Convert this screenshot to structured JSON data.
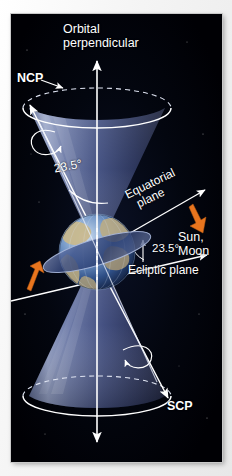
{
  "figure": {
    "domain": "diagram",
    "background_color": "#000006",
    "page_color": "#f2f2f2",
    "plate": {
      "x": 11,
      "y": 14,
      "width": 211,
      "height": 448
    }
  },
  "labels": {
    "orbital_perpendicular": "Orbital\nperpendicular",
    "ncp": "NCP",
    "scp": "SCP",
    "angle_top": "23.5°",
    "angle_bottom": "23.5°",
    "equatorial_plane": "Equatorial\n  plane",
    "ecliptic_plane": "Ecliptic plane",
    "sun_moon": "Sun,\nMoon"
  },
  "colors": {
    "line": "#ffffff",
    "cone_light": "#b9c4dd",
    "cone_mid": "#4b5f93",
    "cone_dark": "#141c38",
    "orange_arrow": "#e8751e",
    "earth_ocean": "#2f5fa8",
    "earth_land": "#c9b88c",
    "equator_disc": "#2a3f72",
    "dashed": "#dfe4f2"
  },
  "elements": {
    "orbital_axis": {
      "name": "orbital-perpendicular-axis",
      "direction": "vertical",
      "arrows": "both-ends"
    },
    "upper_cone": {
      "name": "precession-cone-north",
      "apex": "earth-center",
      "rim": "top-ellipse"
    },
    "lower_cone": {
      "name": "precession-cone-south",
      "apex": "earth-center",
      "rim": "bottom-ellipse"
    },
    "earth": {
      "name": "earth-globe",
      "tilt_degrees": 23.5
    },
    "equatorial_disc": {
      "name": "equatorial-plane-disc"
    },
    "ecliptic_line": {
      "name": "ecliptic-plane-line"
    },
    "equatorial_line": {
      "name": "equatorial-plane-line"
    },
    "rotation_loop_top": {
      "name": "precession-loop-north"
    },
    "rotation_loop_bottom": {
      "name": "precession-loop-south"
    },
    "orange_arrow_left": {
      "name": "orange-arrow-left",
      "points": "up-right"
    },
    "orange_arrow_right": {
      "name": "orange-arrow-right",
      "points": "down-right"
    }
  }
}
